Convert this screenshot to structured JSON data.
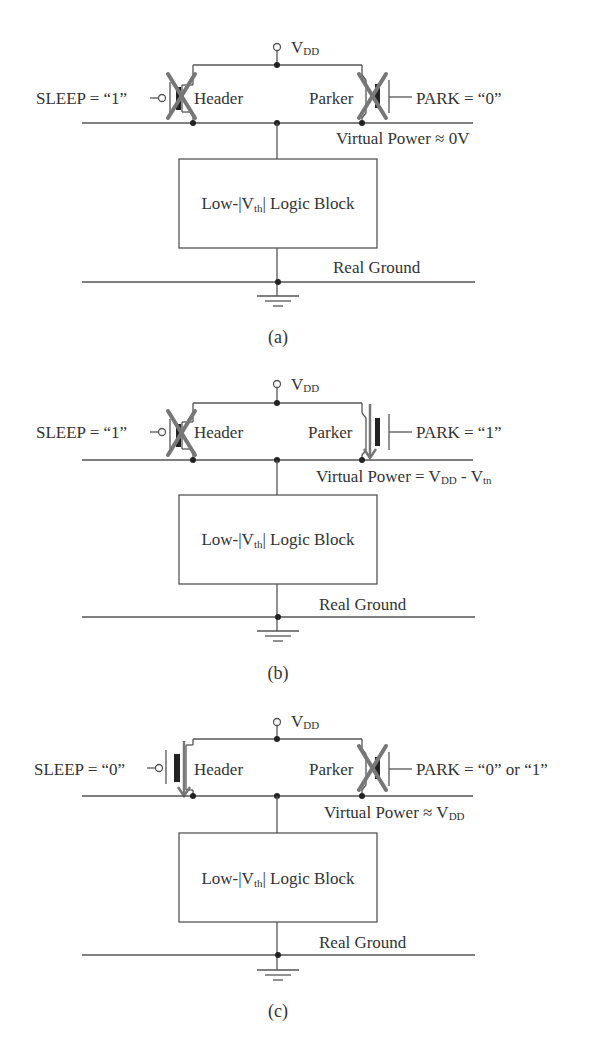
{
  "figure": {
    "panels": [
      {
        "id": "a",
        "caption": "(a)",
        "vdd_label": "V",
        "vdd_sub": "DD",
        "sleep_label": "SLEEP = “1”",
        "header_label": "Header",
        "header_state": "off",
        "parker_label": "Parker",
        "parker_state": "off",
        "park_label": "PARK = “0”",
        "virtual_power_label": "Virtual Power ≈ 0V",
        "virtual_power_sub": "",
        "virtual_power_tail": "",
        "virtual_power_tail_sub": "",
        "logic_block_pre": "Low-|V",
        "logic_block_sub": "th",
        "logic_block_post": "| Logic Block",
        "ground_label": "Real Ground"
      },
      {
        "id": "b",
        "caption": "(b)",
        "vdd_label": "V",
        "vdd_sub": "DD",
        "sleep_label": "SLEEP = “1”",
        "header_label": "Header",
        "header_state": "off",
        "parker_label": "Parker",
        "parker_state": "on",
        "park_label": "PARK = “1”",
        "virtual_power_label": "Virtual Power = V",
        "virtual_power_sub": "DD",
        "virtual_power_tail": " - V",
        "virtual_power_tail_sub": "tn",
        "logic_block_pre": "Low-|V",
        "logic_block_sub": "th",
        "logic_block_post": "| Logic Block",
        "ground_label": "Real Ground"
      },
      {
        "id": "c",
        "caption": "(c)",
        "vdd_label": "V",
        "vdd_sub": "DD",
        "sleep_label": "SLEEP = “0”",
        "header_label": "Header",
        "header_state": "on",
        "parker_label": "Parker",
        "parker_state": "off",
        "park_label": "PARK = “0” or “1”",
        "virtual_power_label": "Virtual Power ≈ V",
        "virtual_power_sub": "DD",
        "virtual_power_tail": "",
        "virtual_power_tail_sub": "",
        "logic_block_pre": "Low-|V",
        "logic_block_sub": "th",
        "logic_block_post": "| Logic Block",
        "ground_label": "Real Ground"
      }
    ],
    "colors": {
      "wire": "#555555",
      "cross_mark": "#777777",
      "conduction_arrow": "#777777",
      "text": "#333333"
    }
  }
}
